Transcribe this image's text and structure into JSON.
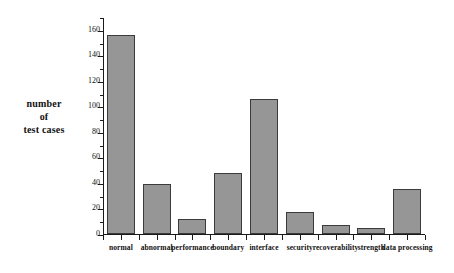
{
  "chart_data": {
    "type": "bar",
    "title": "",
    "xlabel": "",
    "ylabel": "number\nof\ntest cases",
    "ylabel_lines": [
      "number",
      "of",
      "test cases"
    ],
    "categories": [
      "normal",
      "abnormal",
      "performance",
      "boundary",
      "interface",
      "security",
      "recoverability",
      "strength",
      "data processing"
    ],
    "values": [
      156,
      39,
      12,
      48,
      106,
      17,
      7,
      5,
      35
    ],
    "ylim": [
      0,
      170
    ],
    "ytick_labels": [
      "0",
      "20",
      "40",
      "60",
      "80",
      "100",
      "120",
      "140",
      "160"
    ],
    "ytick_values": [
      0,
      20,
      40,
      60,
      80,
      100,
      120,
      140,
      160
    ],
    "yminor_tick_values": [
      10,
      30,
      50,
      70,
      90,
      110,
      130,
      150,
      170
    ],
    "grid": false,
    "legend": null,
    "series": [
      {
        "name": "test cases",
        "values": [
          156,
          39,
          12,
          48,
          106,
          17,
          7,
          5,
          35
        ]
      }
    ],
    "colors": {
      "bar_fill": "#969696",
      "bar_edge": "#3b3b3b",
      "axis": "#1a1a1a",
      "text": "#111111",
      "background": "#ffffff"
    }
  }
}
